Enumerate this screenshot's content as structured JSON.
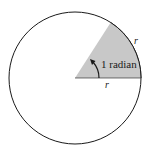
{
  "diagram": {
    "labels": {
      "angle": "1 radian",
      "arc": "r",
      "radius": "r"
    },
    "colors": {
      "circle_stroke": "#1a1a1a",
      "sector_fill": "#c8c8c8",
      "background": "#ffffff"
    },
    "geometry": {
      "center": [
        75,
        78
      ],
      "radius": 66,
      "sector_angle_deg": 57.3
    }
  }
}
